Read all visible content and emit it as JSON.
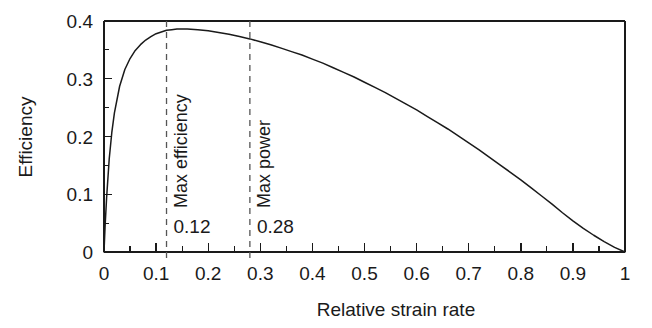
{
  "chart_data": {
    "type": "line",
    "title": "",
    "xlabel": "Relative strain rate",
    "ylabel": "Efficiency",
    "xlim": [
      0,
      1
    ],
    "ylim": [
      0,
      0.4
    ],
    "grid": false,
    "legend": null,
    "x_ticks": [
      "0",
      "0.1",
      "0.2",
      "0.3",
      "0.4",
      "0.5",
      "0.6",
      "0.7",
      "0.8",
      "0.9",
      "1"
    ],
    "x_tick_values": [
      0,
      0.1,
      0.2,
      0.3,
      0.4,
      0.5,
      0.6,
      0.7,
      0.8,
      0.9,
      1
    ],
    "x_minor_tick_values": [
      0.05,
      0.15,
      0.25,
      0.35,
      0.45,
      0.55,
      0.65,
      0.75,
      0.85,
      0.95
    ],
    "y_ticks": [
      "0",
      "0.1",
      "0.2",
      "0.3",
      "0.4"
    ],
    "y_tick_values": [
      0,
      0.1,
      0.2,
      0.3,
      0.4
    ],
    "y_minor_tick_values": [
      0.05,
      0.15,
      0.25,
      0.35
    ],
    "line_color": "#1a1a1a",
    "series": [
      {
        "name": "Efficiency",
        "x": [
          0,
          0.002,
          0.005,
          0.01,
          0.015,
          0.02,
          0.03,
          0.04,
          0.05,
          0.06,
          0.07,
          0.08,
          0.09,
          0.1,
          0.11,
          0.12,
          0.13,
          0.14,
          0.15,
          0.16,
          0.18,
          0.2,
          0.22,
          0.24,
          0.26,
          0.28,
          0.3,
          0.32,
          0.34,
          0.36,
          0.38,
          0.4,
          0.42,
          0.44,
          0.46,
          0.48,
          0.5,
          0.52,
          0.54,
          0.56,
          0.58,
          0.6,
          0.62,
          0.64,
          0.66,
          0.68,
          0.7,
          0.72,
          0.74,
          0.76,
          0.78,
          0.8,
          0.82,
          0.84,
          0.86,
          0.88,
          0.9,
          0.92,
          0.94,
          0.96,
          0.98,
          1
        ],
        "y": [
          0,
          0.043,
          0.094,
          0.161,
          0.207,
          0.241,
          0.287,
          0.316,
          0.335,
          0.349,
          0.359,
          0.367,
          0.373,
          0.378,
          0.381,
          0.384,
          0.385,
          0.386,
          0.386,
          0.386,
          0.385,
          0.383,
          0.38,
          0.377,
          0.373,
          0.369,
          0.364,
          0.359,
          0.353,
          0.347,
          0.341,
          0.334,
          0.327,
          0.319,
          0.311,
          0.303,
          0.294,
          0.285,
          0.276,
          0.266,
          0.256,
          0.246,
          0.235,
          0.224,
          0.213,
          0.201,
          0.189,
          0.177,
          0.164,
          0.151,
          0.138,
          0.125,
          0.111,
          0.097,
          0.083,
          0.068,
          0.054,
          0.041,
          0.029,
          0.018,
          0.008,
          0
        ]
      }
    ],
    "annotations": [
      {
        "name": "max-efficiency",
        "label": "Max efficiency",
        "value_label": "0.12",
        "x": 0.12,
        "style": "dashed-vline"
      },
      {
        "name": "max-power",
        "label": "Max power",
        "value_label": "0.28",
        "x": 0.28,
        "style": "dashed-vline"
      }
    ]
  }
}
